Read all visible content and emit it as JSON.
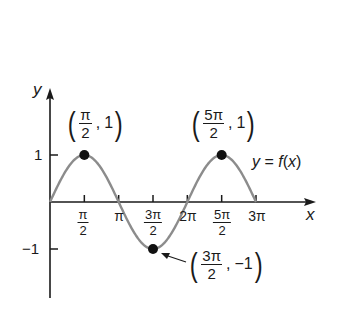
{
  "chart_data": {
    "type": "line",
    "title": "",
    "function_label": "y = f(x)",
    "xlabel": "x",
    "ylabel": "y",
    "xlim": [
      0,
      3.14159
    ],
    "x_domain_label": "[0, 3π]",
    "ylim": [
      -1,
      1
    ],
    "grid": false,
    "legend": null,
    "series": [
      {
        "name": "y = f(x)",
        "formula": "sin(x)",
        "color": "#8c8c8c",
        "x": [
          0,
          1.5708,
          3.1416,
          4.7124,
          6.2832,
          7.854,
          9.4248
        ],
        "values": [
          0,
          1,
          0,
          -1,
          0,
          1,
          0
        ]
      }
    ],
    "x_ticks": [
      {
        "value": 1.5708,
        "num": "π",
        "den": "2",
        "label": "π/2"
      },
      {
        "value": 3.1416,
        "label": "π"
      },
      {
        "value": 4.7124,
        "num": "3π",
        "den": "2",
        "label": "3π/2"
      },
      {
        "value": 6.2832,
        "label": "2π"
      },
      {
        "value": 7.854,
        "num": "5π",
        "den": "2",
        "label": "5π/2"
      },
      {
        "value": 9.4248,
        "label": "3π"
      }
    ],
    "y_ticks": [
      {
        "value": 1,
        "label": "1"
      },
      {
        "value": -1,
        "label": "−1"
      }
    ],
    "annotations": [
      {
        "x": 1.5708,
        "y": 1,
        "num": "π",
        "den": "2",
        "yval": "1",
        "text": "(π/2, 1)"
      },
      {
        "x": 7.854,
        "y": 1,
        "num": "5π",
        "den": "2",
        "yval": "1",
        "text": "(5π/2, 1)"
      },
      {
        "x": 4.7124,
        "y": -1,
        "num": "3π",
        "den": "2",
        "yval": "−1",
        "text": "(3π/2, −1)",
        "arrow": true
      }
    ],
    "colors": {
      "curve": "#8c8c8c",
      "axis": "#1a1a1a",
      "point": "#111111"
    }
  },
  "labels": {
    "x_axis": "x",
    "y_axis": "y",
    "func_y": "y",
    "func_eq": " = ",
    "func_f": "f",
    "func_open": "(",
    "func_x": "x",
    "func_close": ")",
    "tick_pi": "π",
    "tick_2pi": "2π",
    "tick_3pi": "3π",
    "tick_pi2_num": "π",
    "tick_pi2_den": "2",
    "tick_3pi2_num": "3π",
    "tick_3pi2_den": "2",
    "tick_5pi2_num": "5π",
    "tick_5pi2_den": "2",
    "y_one": "1",
    "y_neg_one": "−1",
    "p1_num": "π",
    "p1_den": "2",
    "p1_y": "1",
    "p2_num": "5π",
    "p2_den": "2",
    "p2_y": "1",
    "p3_num": "3π",
    "p3_den": "2",
    "p3_y": "−1",
    "open_paren": "(",
    "close_paren": ")",
    "comma": ","
  }
}
